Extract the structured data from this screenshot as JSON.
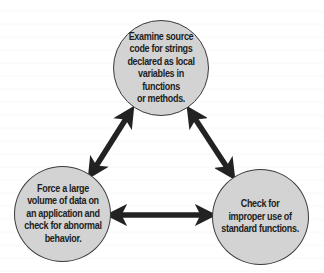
{
  "diagram": {
    "type": "cycle",
    "nodes": [
      {
        "id": "top",
        "label": "Examine source\ncode for strings\ndeclared as local\nvariables in functions\nor methods."
      },
      {
        "id": "left",
        "label": "Force a large\nvolume of data on\nan application and\ncheck for abnormal\nbehavior."
      },
      {
        "id": "right",
        "label": "Check for\nimproper use of\nstandard functions."
      }
    ],
    "edges": [
      {
        "from": "top",
        "to": "left",
        "direction": "bidirectional"
      },
      {
        "from": "top",
        "to": "right",
        "direction": "bidirectional"
      },
      {
        "from": "left",
        "to": "right",
        "direction": "bidirectional"
      }
    ],
    "colors": {
      "node_fill": "#d3d3d3",
      "node_border": "#3a3a3a",
      "arrow": "#222222",
      "text": "#1e1e1e",
      "background": "#ffffff"
    }
  }
}
